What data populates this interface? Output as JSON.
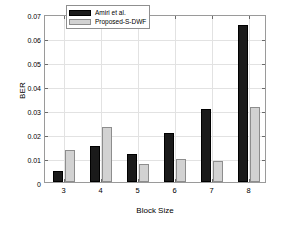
{
  "chart_data": {
    "type": "bar",
    "title": "",
    "xlabel": "Block Size",
    "ylabel": "BER",
    "categories": [
      "3",
      "4",
      "5",
      "6",
      "7",
      "8"
    ],
    "series": [
      {
        "name": "Amiri et al.",
        "color": "#1a1a1a",
        "values": [
          0.0047,
          0.0151,
          0.0117,
          0.0205,
          0.0304,
          0.0655
        ]
      },
      {
        "name": "Proposed-S-DWF",
        "color": "#d2d2d2",
        "values": [
          0.0132,
          0.023,
          0.0074,
          0.0096,
          0.0089,
          0.0313
        ]
      }
    ],
    "ylim": [
      0,
      0.07
    ],
    "yticks": [
      0,
      0.01,
      0.02,
      0.03,
      0.04,
      0.05,
      0.06,
      0.07
    ],
    "ytick_labels": [
      "0",
      "0.01",
      "0.02",
      "0.03",
      "0.04",
      "0.05",
      "0.06",
      "0.07"
    ],
    "xtick_labels": [
      "3",
      "4",
      "5",
      "6",
      "7",
      "8"
    ],
    "grid": true,
    "legend_position": "top-center",
    "background_color": "#ffffff",
    "grid_color": "#e2e2e2",
    "axis_color": "#9a9a9a"
  }
}
